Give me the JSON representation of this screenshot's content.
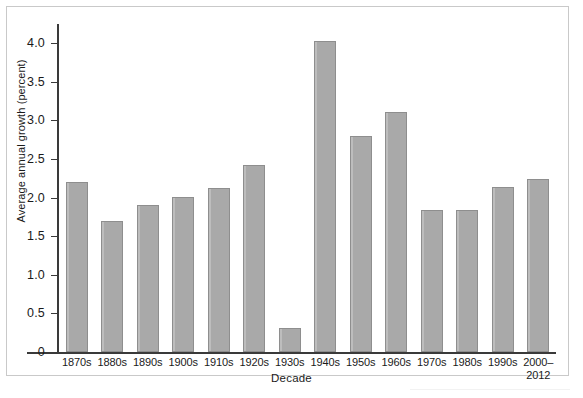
{
  "chart_data": {
    "type": "bar",
    "title": "",
    "xlabel": "Decade",
    "ylabel": "Average annual growth (percent)",
    "categories": [
      "1870s",
      "1880s",
      "1890s",
      "1900s",
      "1910s",
      "1920s",
      "1930s",
      "1940s",
      "1950s",
      "1960s",
      "1970s",
      "1980s",
      "1990s",
      "2000–\n2012"
    ],
    "category_labels": [
      {
        "line1": "1870s",
        "line2": ""
      },
      {
        "line1": "1880s",
        "line2": ""
      },
      {
        "line1": "1890s",
        "line2": ""
      },
      {
        "line1": "1900s",
        "line2": ""
      },
      {
        "line1": "1910s",
        "line2": ""
      },
      {
        "line1": "1920s",
        "line2": ""
      },
      {
        "line1": "1930s",
        "line2": ""
      },
      {
        "line1": "1940s",
        "line2": ""
      },
      {
        "line1": "1950s",
        "line2": ""
      },
      {
        "line1": "1960s",
        "line2": ""
      },
      {
        "line1": "1970s",
        "line2": ""
      },
      {
        "line1": "1980s",
        "line2": ""
      },
      {
        "line1": "1990s",
        "line2": ""
      },
      {
        "line1": "2000–",
        "line2": "2012"
      }
    ],
    "values": [
      2.2,
      1.7,
      1.91,
      2.01,
      2.13,
      2.42,
      0.31,
      4.03,
      2.8,
      3.11,
      1.84,
      1.84,
      2.14,
      2.24
    ],
    "ylim": [
      0,
      4.25
    ],
    "yticks": [
      0,
      0.5,
      1.0,
      1.5,
      2.0,
      2.5,
      3.0,
      3.5,
      4.0
    ],
    "ytick_labels": [
      "0",
      "0.5",
      "1.0",
      "1.5",
      "2.0",
      "2.5",
      "3.0",
      "3.5",
      "4.0"
    ],
    "grid": false,
    "legend": null,
    "bar_color": "#a9a9a9",
    "bar_border_color": "#8e8e8e",
    "axis_color": "#3a3a3a",
    "frame_color": "#c9c9c9",
    "background": "#ffffff"
  }
}
